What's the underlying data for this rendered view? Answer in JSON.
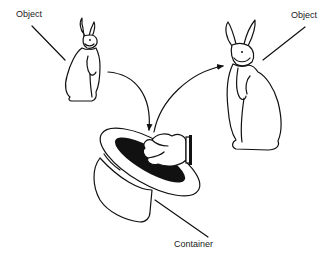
{
  "diagram": {
    "labels": {
      "object_left": "Object",
      "object_right": "Object",
      "container": "Container"
    },
    "elements": [
      {
        "id": "rabbit-left",
        "type": "object",
        "icon": "rabbit-icon"
      },
      {
        "id": "rabbit-right",
        "type": "object",
        "icon": "rabbit-icon"
      },
      {
        "id": "top-hat",
        "type": "container",
        "icon": "top-hat-icon"
      },
      {
        "id": "hand",
        "type": "decoration",
        "icon": "gloved-hand-icon"
      }
    ],
    "arrows": [
      {
        "from": "rabbit-left",
        "to": "top-hat",
        "label": ""
      },
      {
        "from": "top-hat",
        "to": "rabbit-right",
        "label": ""
      }
    ],
    "colors": {
      "line": "#111111",
      "background": "#ffffff",
      "hat_interior": "#111111"
    }
  }
}
